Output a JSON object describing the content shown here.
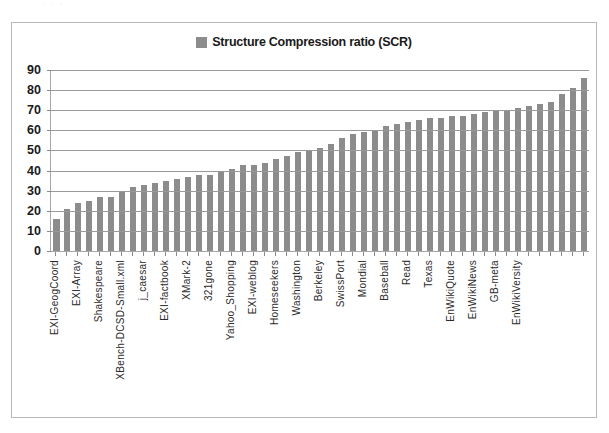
{
  "top_artifact": "· · ·",
  "legend": {
    "swatch_color": "#8c8c8c",
    "label": "Structure Compression ratio (SCR)"
  },
  "chart_data": {
    "type": "bar",
    "title": "",
    "subtitle": "",
    "xlabel": "",
    "ylabel": "",
    "ylim": [
      0,
      90
    ],
    "ytick_step": 10,
    "yticks": [
      90,
      80,
      70,
      60,
      50,
      40,
      30,
      20,
      10,
      0
    ],
    "grid": true,
    "legend_position": "top-center",
    "bar_color": "#8c8c8c",
    "series": [
      {
        "name": "Structure Compression ratio (SCR)",
        "values": [
          16,
          21,
          24,
          25,
          27,
          27,
          30,
          32,
          33,
          34,
          35,
          36,
          37,
          38,
          38,
          40,
          41,
          43,
          43,
          44,
          46,
          47,
          49,
          50,
          51,
          53,
          56,
          58,
          59,
          60,
          62,
          63,
          64,
          65,
          66,
          66,
          67,
          67,
          68,
          69,
          70,
          70,
          71,
          72,
          73,
          74,
          78,
          81,
          86
        ]
      }
    ],
    "categories": [
      "EXI-GeogCoord",
      "",
      "EXI-Array",
      "",
      "Shakespeare",
      "",
      "XBench-DCSD-Small.xml",
      "",
      "j_caesar",
      "",
      "EXI-factbook",
      "",
      "XMark-2",
      "",
      "321gone",
      "",
      "Yahoo_Shopping",
      "",
      "EXI-weblog",
      "",
      "Homeseekers",
      "",
      "Washington",
      "",
      "Berkeley",
      "",
      "SwissPort",
      "",
      "Mondial",
      "",
      "Baseball",
      "",
      "Read",
      "",
      "Texas",
      "",
      "EnWikiQuote",
      "",
      "EnWikiNews",
      "",
      "GB-meta",
      "",
      "EnWikiVersity",
      "",
      "",
      "",
      "",
      "",
      ""
    ],
    "labeled_categories": [
      "EXI-GeogCoord",
      "EXI-Array",
      "Shakespeare",
      "XBench-DCSD-Small.xml",
      "j_caesar",
      "EXI-factbook",
      "XMark-2",
      "321gone",
      "Yahoo_Shopping",
      "EXI-weblog",
      "Homeseekers",
      "Washington",
      "Berkeley",
      "SwissPort",
      "Mondial",
      "Baseball",
      "Read",
      "Texas",
      "EnWikiQuote",
      "EnWikiNews",
      "GB-meta",
      "EnWikiVersity"
    ]
  }
}
